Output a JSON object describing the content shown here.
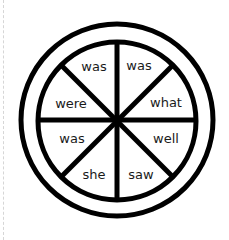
{
  "diagram": {
    "type": "word-wheel",
    "segments": [
      {
        "position": "top-left",
        "word": "was"
      },
      {
        "position": "top-right",
        "word": "was"
      },
      {
        "position": "upper-right",
        "word": "what"
      },
      {
        "position": "lower-right",
        "word": "well"
      },
      {
        "position": "bottom-right",
        "word": "saw"
      },
      {
        "position": "bottom-left",
        "word": "she"
      },
      {
        "position": "lower-left",
        "word": "was"
      },
      {
        "position": "upper-left",
        "word": "were"
      }
    ],
    "colors": {
      "stroke": "#000000",
      "background": "#ffffff",
      "text": "#1a1a1a",
      "edge": "#d6d6d6"
    }
  }
}
